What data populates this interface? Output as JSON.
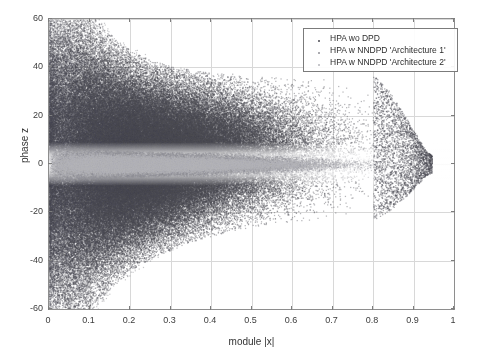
{
  "chart_data": {
    "type": "scatter",
    "title": "",
    "xlabel": "module |x|",
    "ylabel": "phase z",
    "xlim": [
      0,
      1
    ],
    "ylim": [
      -60,
      60
    ],
    "xticks": [
      "0",
      "0.1",
      "0.2",
      "0.3",
      "0.4",
      "0.5",
      "0.6",
      "0.7",
      "0.8",
      "0.9",
      "1"
    ],
    "xtick_values": [
      0,
      0.1,
      0.2,
      0.3,
      0.4,
      0.5,
      0.6,
      0.7,
      0.8,
      0.9,
      1
    ],
    "yticks": [
      "60",
      "40",
      "20",
      "0",
      "-20",
      "-40",
      "-60"
    ],
    "ytick_values": [
      60,
      40,
      20,
      0,
      -20,
      -40,
      -60
    ],
    "grid": true,
    "legend_position": "top-right",
    "series": [
      {
        "name": "HPA wo DPD",
        "color": "#4a4a52",
        "marker": "dot",
        "description": "Uncorrected HPA output: wide bowtie/funnel phase spread, saturating the full -60..60 range near |x|=0 and narrowing toward larger amplitudes",
        "envelope": [
          {
            "x": 0.0,
            "upper": 60,
            "lower": -60
          },
          {
            "x": 0.02,
            "upper": 60,
            "lower": -60
          },
          {
            "x": 0.05,
            "upper": 60,
            "lower": -60
          },
          {
            "x": 0.08,
            "upper": 56,
            "lower": -54
          },
          {
            "x": 0.12,
            "upper": 48,
            "lower": -46
          },
          {
            "x": 0.16,
            "upper": 42,
            "lower": -40
          },
          {
            "x": 0.2,
            "upper": 38,
            "lower": -35
          },
          {
            "x": 0.25,
            "upper": 35,
            "lower": -31
          },
          {
            "x": 0.3,
            "upper": 33,
            "lower": -28
          },
          {
            "x": 0.35,
            "upper": 32,
            "lower": -25
          },
          {
            "x": 0.4,
            "upper": 31,
            "lower": -23
          },
          {
            "x": 0.45,
            "upper": 31,
            "lower": -21
          },
          {
            "x": 0.5,
            "upper": 30,
            "lower": -20
          },
          {
            "x": 0.55,
            "upper": 30,
            "lower": -19
          },
          {
            "x": 0.6,
            "upper": 30,
            "lower": -18
          },
          {
            "x": 0.65,
            "upper": 30,
            "lower": -17
          },
          {
            "x": 0.7,
            "upper": 30,
            "lower": -16
          },
          {
            "x": 0.75,
            "upper": 29,
            "lower": -15
          },
          {
            "x": 0.8,
            "upper": 27,
            "lower": -13
          },
          {
            "x": 0.84,
            "upper": 22,
            "lower": -11
          },
          {
            "x": 0.88,
            "upper": 14,
            "lower": -8
          },
          {
            "x": 0.91,
            "upper": 8,
            "lower": -5
          },
          {
            "x": 0.93,
            "upper": 4,
            "lower": -3
          },
          {
            "x": 0.95,
            "upper": 2,
            "lower": -2
          }
        ]
      },
      {
        "name": "HPA w NNDPD 'Architecture 1'",
        "color": "#8f8f96",
        "marker": "dot",
        "description": "Neural-network DPD architecture 1: phase error collapsed into a narrow light band centred on z = 0",
        "envelope": [
          {
            "x": 0.0,
            "upper": 7,
            "lower": -7
          },
          {
            "x": 0.05,
            "upper": 6,
            "lower": -6
          },
          {
            "x": 0.1,
            "upper": 5,
            "lower": -5
          },
          {
            "x": 0.2,
            "upper": 4.5,
            "lower": -4.5
          },
          {
            "x": 0.3,
            "upper": 4,
            "lower": -4
          },
          {
            "x": 0.4,
            "upper": 4,
            "lower": -4
          },
          {
            "x": 0.5,
            "upper": 3.5,
            "lower": -3.5
          },
          {
            "x": 0.6,
            "upper": 3.5,
            "lower": -3.5
          },
          {
            "x": 0.7,
            "upper": 3,
            "lower": -3
          },
          {
            "x": 0.8,
            "upper": 3,
            "lower": -3
          },
          {
            "x": 0.88,
            "upper": 2.5,
            "lower": -2.5
          },
          {
            "x": 0.93,
            "upper": 2,
            "lower": -2
          }
        ]
      },
      {
        "name": "HPA w NNDPD 'Architecture 2'",
        "color": "#b4b4ba",
        "marker": "dot",
        "description": "Neural-network DPD architecture 2: phase error also collapsed to a narrow band around z = 0, slightly tighter than architecture 1",
        "envelope": [
          {
            "x": 0.0,
            "upper": 5,
            "lower": -5
          },
          {
            "x": 0.05,
            "upper": 4.5,
            "lower": -4.5
          },
          {
            "x": 0.1,
            "upper": 4,
            "lower": -4
          },
          {
            "x": 0.2,
            "upper": 3.5,
            "lower": -3.5
          },
          {
            "x": 0.3,
            "upper": 3,
            "lower": -3
          },
          {
            "x": 0.4,
            "upper": 3,
            "lower": -3
          },
          {
            "x": 0.5,
            "upper": 2.5,
            "lower": -2.5
          },
          {
            "x": 0.6,
            "upper": 2.5,
            "lower": -2.5
          },
          {
            "x": 0.7,
            "upper": 2,
            "lower": -2
          },
          {
            "x": 0.8,
            "upper": 2,
            "lower": -2
          },
          {
            "x": 0.88,
            "upper": 1.8,
            "lower": -1.8
          },
          {
            "x": 0.93,
            "upper": 1.5,
            "lower": -1.5
          }
        ]
      }
    ]
  },
  "legend": {
    "entries": [
      {
        "label": "HPA wo DPD",
        "color": "#4a4a52"
      },
      {
        "label": "HPA w NNDPD 'Architecture 1'",
        "color": "#8f8f96"
      },
      {
        "label": "HPA w NNDPD 'Architecture 2'",
        "color": "#b4b4ba"
      }
    ]
  },
  "axes": {
    "x_title": "module |x|",
    "y_title": "phase z",
    "x_tick_labels": [
      "0",
      "0.1",
      "0.2",
      "0.3",
      "0.4",
      "0.5",
      "0.6",
      "0.7",
      "0.8",
      "0.9",
      "1"
    ],
    "y_tick_labels": [
      "60",
      "40",
      "20",
      "0",
      "-20",
      "-40",
      "-60"
    ]
  },
  "colors": {
    "background": "#ffffff",
    "axis": "#8e8e8e",
    "grid": "#d8d8d8",
    "text": "#3a3a3a"
  }
}
